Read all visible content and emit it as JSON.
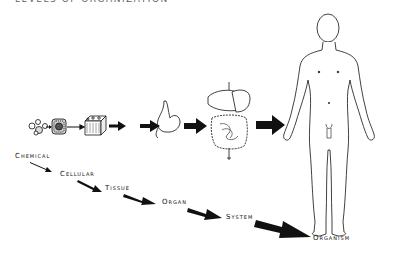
{
  "title": "LEVELS OF ORGANIZATION",
  "levels": [
    {
      "label": "Chemical",
      "icon": "molecule-icon"
    },
    {
      "label": "Cellular",
      "icon": "cell-icon"
    },
    {
      "label": "Tissue",
      "icon": "tissue-icon"
    },
    {
      "label": "Organ",
      "icon": "stomach-icon"
    },
    {
      "label": "System",
      "icon": "digestive-system-icon"
    },
    {
      "label": "Organism",
      "icon": "human-body-icon"
    }
  ],
  "colors": {
    "ink": "#111111",
    "background": "#ffffff"
  }
}
